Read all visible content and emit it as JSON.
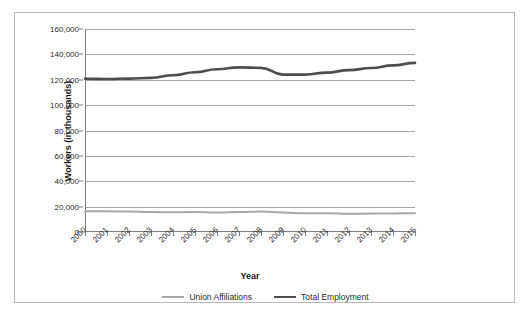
{
  "chart_data": {
    "type": "line",
    "title": "",
    "subtitle": "",
    "xlabel": "Year",
    "ylabel": "Workers (in thousands)",
    "x": [
      2000,
      2001,
      2002,
      2003,
      2004,
      2005,
      2006,
      2007,
      2008,
      2009,
      2010,
      2011,
      2012,
      2013,
      2014,
      2015
    ],
    "categories": [
      "2000",
      "2001",
      "2002",
      "2003",
      "2004",
      "2005",
      "2006",
      "2007",
      "2008",
      "2009",
      "2010",
      "2011",
      "2012",
      "2013",
      "2014",
      "2015"
    ],
    "series": [
      {
        "name": "Union Affiliations",
        "color": "#a8a8a8",
        "values": [
          16258,
          16275,
          16145,
          15776,
          15472,
          15685,
          15359,
          15670,
          16098,
          15327,
          14715,
          14764,
          14366,
          14528,
          14576,
          14795
        ]
      },
      {
        "name": "Total Employment",
        "color": "#4d4d4d",
        "values": [
          120786,
          120601,
          120875,
          121454,
          123554,
          125889,
          128232,
          129767,
          129377,
          124065,
          124073,
          125627,
          127547,
          129211,
          131353,
          133262
        ]
      }
    ],
    "ylim": [
      0,
      160000
    ],
    "ytick_values": [
      0,
      20000,
      40000,
      60000,
      80000,
      100000,
      120000,
      140000,
      160000
    ],
    "ytick_labels": [
      "0",
      "20,000",
      "40,000",
      "60,000",
      "80,000",
      "100,000",
      "120,000",
      "140,000",
      "160,000"
    ],
    "grid": true,
    "legend_position": "bottom",
    "legend_entries": [
      "Union Affiliations",
      "Total Employment"
    ],
    "background_color": "#ffffff",
    "gridline_color": "#a6a6a6",
    "border_color": "#b9b9b9"
  }
}
